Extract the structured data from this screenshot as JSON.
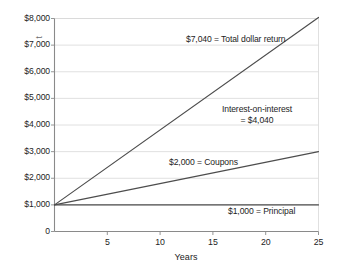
{
  "chart_data": {
    "type": "line",
    "title": "",
    "xlabel": "Years",
    "ylabel": "",
    "y_axis_title_partial": "t",
    "xlim": [
      0,
      25
    ],
    "ylim": [
      0,
      8000
    ],
    "grid": true,
    "legend_position": "inline-annotations",
    "x_ticks": [
      {
        "value": 5,
        "label": "5"
      },
      {
        "value": 10,
        "label": "10"
      },
      {
        "value": 15,
        "label": "15"
      },
      {
        "value": 20,
        "label": "20"
      },
      {
        "value": 25,
        "label": "25"
      }
    ],
    "y_ticks": [
      {
        "value": 8000,
        "label": "$8,000"
      },
      {
        "value": 7000,
        "label": "$7,000"
      },
      {
        "value": 6000,
        "label": "$6,000"
      },
      {
        "value": 5000,
        "label": "$5,000"
      },
      {
        "value": 4000,
        "label": "$4,000"
      },
      {
        "value": 3000,
        "label": "$3,000"
      },
      {
        "value": 2000,
        "label": "$2,000"
      },
      {
        "value": 1000,
        "label": "$1,000"
      },
      {
        "value": 0,
        "label": "0"
      }
    ],
    "series": [
      {
        "name": "Total value",
        "x": [
          0,
          25
        ],
        "values": [
          1000,
          8040
        ],
        "color": "#4d4d4d"
      },
      {
        "name": "Principal plus coupons",
        "x": [
          0,
          25
        ],
        "values": [
          1000,
          3000
        ],
        "color": "#4d4d4d"
      },
      {
        "name": "Principal",
        "x": [
          0,
          25
        ],
        "values": [
          1000,
          1000
        ],
        "color": "#4d4d4d"
      }
    ],
    "annotations": [
      {
        "id": "total",
        "text": "$7,040  =  Total dollar return",
        "value": 7040
      },
      {
        "id": "ioi_line1",
        "text": "Interest-on-interest",
        "value": 4040
      },
      {
        "id": "ioi_line2",
        "text": "= $4,040",
        "value": 4040
      },
      {
        "id": "coupons",
        "text": "$2,000  =  Coupons",
        "value": 2000
      },
      {
        "id": "principal",
        "text": "$1,000  =  Principal",
        "value": 1000
      }
    ]
  },
  "colors": {
    "line": "#4d4d4d",
    "grid": "#d8d8d8",
    "axis": "#8a8a8a",
    "text": "#1d1d1d",
    "background": "#ffffff"
  }
}
